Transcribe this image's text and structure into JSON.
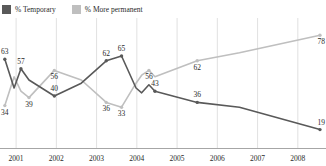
{
  "chart_data": {
    "type": "line",
    "title": "",
    "subtitle": "",
    "xlabel": "",
    "ylabel": "",
    "grid": "vertical",
    "legend_position": "top-left",
    "xlim": [
      2000.6,
      2008.7
    ],
    "ylim": [
      10,
      85
    ],
    "xticks": [
      2001,
      2002,
      2003,
      2004,
      2005,
      2006,
      2007,
      2008
    ],
    "xtick_labels": [
      "2001",
      "2002",
      "2003",
      "2004",
      "2005",
      "2006",
      "2007",
      "2008"
    ],
    "series": [
      {
        "name": "% Temporary",
        "color": "#595959",
        "x": [
          2000.72,
          2000.95,
          2001.12,
          2001.32,
          2001.95,
          2002.62,
          2003.24,
          2003.62,
          2003.98,
          2004.12,
          2004.3,
          2004.45,
          2005.5,
          2006.55,
          2008.55
        ],
        "values": [
          63,
          45,
          57,
          50,
          40,
          48,
          62,
          65,
          45,
          42,
          47,
          43,
          36,
          33,
          19
        ],
        "labeled_points": [
          {
            "x": 2000.72,
            "value": 63,
            "label": "63"
          },
          {
            "x": 2001.12,
            "value": 57,
            "label": "57"
          },
          {
            "x": 2001.95,
            "value": 40,
            "label": "40"
          },
          {
            "x": 2003.24,
            "value": 62,
            "label": "62"
          },
          {
            "x": 2003.62,
            "value": 65,
            "label": "65"
          },
          {
            "x": 2004.45,
            "value": 43,
            "label": "43"
          },
          {
            "x": 2005.5,
            "value": 36,
            "label": "36"
          },
          {
            "x": 2008.55,
            "value": 19,
            "label": "19"
          }
        ]
      },
      {
        "name": "% More permanent",
        "color": "#bfbfbf",
        "x": [
          2000.72,
          2000.95,
          2001.12,
          2001.32,
          2001.95,
          2002.62,
          2003.24,
          2003.62,
          2003.98,
          2004.12,
          2004.3,
          2004.45,
          2005.5,
          2006.55,
          2008.55
        ],
        "values": [
          34,
          52,
          43,
          39,
          56,
          50,
          36,
          33,
          48,
          53,
          56,
          52,
          62,
          67,
          78
        ],
        "labeled_points": [
          {
            "x": 2000.72,
            "value": 34,
            "label": "34"
          },
          {
            "x": 2001.32,
            "value": 39,
            "label": "39"
          },
          {
            "x": 2001.95,
            "value": 56,
            "label": "56"
          },
          {
            "x": 2003.24,
            "value": 36,
            "label": "36"
          },
          {
            "x": 2003.62,
            "value": 33,
            "label": "33"
          },
          {
            "x": 2004.3,
            "value": 56,
            "label": "56"
          },
          {
            "x": 2005.5,
            "value": 62,
            "label": "62"
          },
          {
            "x": 2008.55,
            "value": 78,
            "label": "78"
          }
        ]
      }
    ]
  },
  "legend": {
    "items": [
      {
        "label": "% Temporary",
        "color": "#595959"
      },
      {
        "label": "% More permanent",
        "color": "#bfbfbf"
      }
    ]
  },
  "colors": {
    "temporary": "#595959",
    "more_permanent": "#bfbfbf",
    "gridline": "#d9d9d9",
    "axis": "#a6a6a6",
    "text": "#2a2a2a",
    "background": "#ffffff"
  }
}
